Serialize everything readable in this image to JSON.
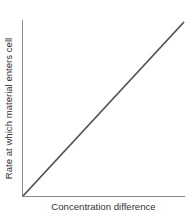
{
  "chart_data": {
    "type": "line",
    "title": "",
    "xlabel": "Concentration difference",
    "ylabel": "Rate at which material enters cell",
    "x": [
      0,
      1
    ],
    "series": [
      {
        "name": "Rate",
        "values": [
          0,
          1
        ]
      }
    ],
    "xlim": [
      0,
      1
    ],
    "ylim": [
      0,
      1
    ],
    "grid": false,
    "legend": "none",
    "ticks": "none"
  },
  "colors": {
    "axis": "#8a8a8a",
    "line": "#555555",
    "text": "#333333"
  }
}
